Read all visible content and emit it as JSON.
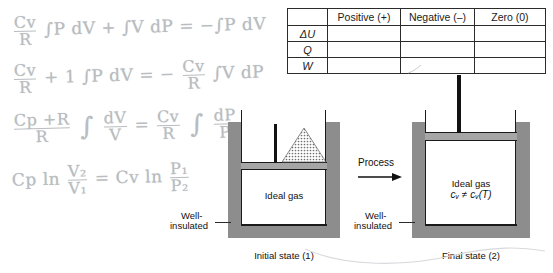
{
  "notes": {
    "title": "Handwritten thermodynamics derivation",
    "lines": [
      {
        "id": "line-1",
        "text": "Cv/R ∫PdV + ∫VdP = -∫PdV",
        "num1": "Cv",
        "den1": "R",
        "seg_a": "∫P dV + ∫V dP = −∫P dV"
      },
      {
        "id": "line-2",
        "text": "Cv/R + 1 ∫PdV = -Cv/R ∫VdP",
        "num1": "Cv",
        "den1": "R",
        "seg_a": "+ 1  ∫P dV = −",
        "num2": "Cv",
        "den2": "R",
        "seg_b": "∫V dP"
      },
      {
        "id": "line-3",
        "text": "(Cp+R)/R ∫dV/V = Cv/R ∫dP/P",
        "num1": "Cp +R",
        "den1": "R",
        "seg_a": "∫",
        "num2": "dV",
        "den2": "V",
        "seg_b": "=",
        "num3": "Cv",
        "den3": "R",
        "seg_c": "∫",
        "num4": "dP",
        "den4": "P"
      },
      {
        "id": "line-4",
        "text": "Cp ln V2/V1 = Cv ln P1/P2",
        "seg_a": "Cp ln",
        "num1": "V₂",
        "den1": "V₁",
        "seg_b": "=  Cv ln",
        "num2": "P₁",
        "den2": "P₂"
      }
    ]
  },
  "table": {
    "name": "sign-convention-table",
    "corner_label": "",
    "columns": [
      "Positive (+)",
      "Negative (–)",
      "Zero (0)"
    ],
    "rows": [
      {
        "label": "ΔU",
        "cells": [
          "",
          "",
          ""
        ]
      },
      {
        "label": "Q",
        "cells": [
          "",
          "",
          ""
        ]
      },
      {
        "label": "W",
        "cells": [
          "",
          "",
          ""
        ]
      }
    ]
  },
  "diagram": {
    "process_label": "Process",
    "initial": {
      "caption": "Initial state (1)",
      "gas_label": "Ideal gas",
      "insulation_label_line1": "Well-",
      "insulation_label_line2": "insulated",
      "sand_label": "sand-pile"
    },
    "final": {
      "caption": "Final state (2)",
      "gas_label": "Ideal gas",
      "gas_sublabel": "cᵥ ≠ cᵥ(T)",
      "insulation_label_line1": "Well-",
      "insulation_label_line2": "insulated"
    }
  },
  "colors": {
    "wall_grey": "#8d8d8d",
    "piston_grey": "#a6a6a6",
    "outline_black": "#1a1a1a",
    "rod_black": "#121212",
    "pencil_grey": "#b9bcc0",
    "text_black": "#111111"
  }
}
